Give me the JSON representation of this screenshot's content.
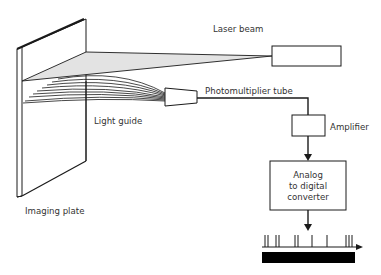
{
  "diagram": {
    "labels": {
      "laser_beam": "Laser beam",
      "photomultiplier_tube": "Photomultiplier tube",
      "light_guide": "Light guide",
      "amplifier": "Amplifier",
      "imaging_plate": "Imaging plate",
      "adc_line1": "Analog",
      "adc_line2": "to digital",
      "adc_line3": "converter"
    },
    "colors": {
      "stroke": "#1a1a1a",
      "beam_fill": "#e3e3e3",
      "text": "#333333",
      "signal_bar": "#000000"
    },
    "components": [
      {
        "id": "imaging-plate",
        "label": "Imaging plate"
      },
      {
        "id": "laser",
        "label": "Laser beam"
      },
      {
        "id": "light-guide",
        "label": "Light guide"
      },
      {
        "id": "photomultiplier-tube",
        "label": "Photomultiplier tube"
      },
      {
        "id": "amplifier",
        "label": "Amplifier"
      },
      {
        "id": "adc",
        "label": "Analog to digital converter"
      },
      {
        "id": "digital-output",
        "label": ""
      }
    ],
    "connections": [
      {
        "from": "laser",
        "to": "imaging-plate"
      },
      {
        "from": "imaging-plate",
        "to": "light-guide"
      },
      {
        "from": "light-guide",
        "to": "photomultiplier-tube"
      },
      {
        "from": "photomultiplier-tube",
        "to": "amplifier"
      },
      {
        "from": "amplifier",
        "to": "adc"
      },
      {
        "from": "adc",
        "to": "digital-output"
      }
    ],
    "pulse_positions_x": [
      265,
      268,
      276,
      279,
      295,
      298,
      312,
      327,
      346,
      349,
      352
    ]
  }
}
